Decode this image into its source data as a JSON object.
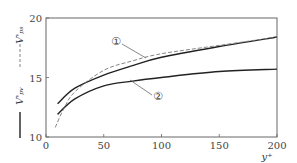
{
  "chart_data": {
    "type": "line",
    "title": "",
    "xlabel": "y⁺",
    "ylabel": "",
    "xlim": [
      0,
      200
    ],
    "ylim": [
      10,
      20
    ],
    "xticks": [
      0,
      50,
      100,
      150,
      200
    ],
    "yticks": [
      10,
      15,
      20
    ],
    "grid": false,
    "legend": {
      "placement": "left-rotated",
      "entries": [
        {
          "label": "V'ₚₛ",
          "style": "dashed"
        },
        {
          "label": "V'ₚᵥ",
          "style": "solid"
        }
      ]
    },
    "annotations": [
      "①",
      "②"
    ],
    "series": [
      {
        "name": "①",
        "style": "solid",
        "x": [
          10,
          25,
          50,
          75,
          100,
          150,
          200
        ],
        "y": [
          12.8,
          14.1,
          15.2,
          16.0,
          16.7,
          17.6,
          18.4
        ]
      },
      {
        "name": "②",
        "style": "solid",
        "x": [
          10,
          25,
          50,
          75,
          100,
          150,
          200
        ],
        "y": [
          11.9,
          13.2,
          14.3,
          14.7,
          15.0,
          15.5,
          15.7
        ]
      },
      {
        "name": "dashed",
        "style": "dashed",
        "x": [
          8,
          15,
          25,
          50,
          75,
          100,
          150,
          200
        ],
        "y": [
          10.8,
          12.3,
          13.8,
          15.6,
          16.4,
          17.0,
          17.7,
          18.4
        ]
      }
    ]
  }
}
